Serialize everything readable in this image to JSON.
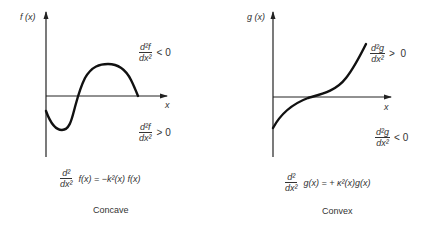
{
  "left_panel": {
    "y_axis_label": "f (x)",
    "x_axis_label": "x",
    "upper_condition": {
      "numerator": "d²f",
      "denominator": "dx²",
      "relation": "< 0"
    },
    "lower_condition": {
      "numerator": "d²f",
      "denominator": "dx²",
      "relation": "> 0"
    },
    "equation": {
      "numerator": "d²",
      "denominator": "dx²",
      "rhs": "f(x) = −k²(x) f(x)"
    },
    "caption": "Concave"
  },
  "right_panel": {
    "y_axis_label": "g (x)",
    "x_axis_label": "x",
    "upper_condition": {
      "numerator": "d²g",
      "denominator": "dx²",
      "relation": ">  0"
    },
    "lower_condition": {
      "numerator": "d²g",
      "denominator": "dx²",
      "relation": "< 0"
    },
    "equation": {
      "numerator": "d²",
      "denominator": "dx²",
      "rhs": "g(x) = + κ²(x)g(x)"
    },
    "caption": "Convex"
  },
  "colors": {
    "ink": "#222222",
    "background": "#ffffff"
  }
}
